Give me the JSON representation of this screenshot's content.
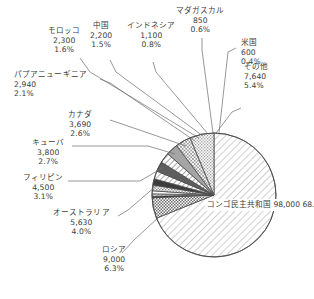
{
  "chart_data": {
    "type": "pie",
    "title": "",
    "subtitle": "",
    "xlabel": "",
    "ylabel": "",
    "legend_position": "none",
    "grid": false,
    "total": 142250,
    "unit": "",
    "label_format": "name / value / percent",
    "categories": [
      "コンゴ民主共和国",
      "ロシア",
      "オーストラリア",
      "フィリピン",
      "キューバ",
      "カナダ",
      "パプアニューギニア",
      "モロッコ",
      "中国",
      "インドネシア",
      "マダガスカル",
      "米国",
      "その他"
    ],
    "values": [
      98000,
      9000,
      5630,
      4500,
      3800,
      3690,
      2940,
      2300,
      2200,
      1100,
      850,
      600,
      7640
    ],
    "percents": [
      "68.9%",
      "6.3%",
      "4.0%",
      "3.1%",
      "2.7%",
      "2.6%",
      "2.1%",
      "1.6%",
      "1.5%",
      "0.8%",
      "0.6%",
      "0.4%",
      "5.4%"
    ],
    "value_labels": [
      "98,000",
      "9,000",
      "5,630",
      "4,500",
      "3,800",
      "3,690",
      "2,940",
      "2,300",
      "2,200",
      "1,100",
      "850",
      "600",
      "7,640"
    ],
    "slices": [
      {
        "name": "コンゴ民主共和国",
        "value_label": "98,000",
        "percent": "68.9%",
        "pct_num": 68.9,
        "fill": "hatch-diag-congo",
        "label_placement": "inside"
      },
      {
        "name": "その他",
        "value_label": "7,640",
        "percent": "5.4%",
        "pct_num": 5.4,
        "fill": "stipple-dark",
        "label_placement": "outside"
      },
      {
        "name": "米国",
        "value_label": "600",
        "percent": "0.4%",
        "pct_num": 0.4,
        "fill": "solid-black",
        "label_placement": "outside"
      },
      {
        "name": "マダガスカル",
        "value_label": "850",
        "percent": "0.6%",
        "pct_num": 0.6,
        "fill": "hatch-fine",
        "label_placement": "outside"
      },
      {
        "name": "インドネシア",
        "value_label": "1,100",
        "percent": "0.8%",
        "pct_num": 0.8,
        "fill": "white-plain",
        "label_placement": "outside"
      },
      {
        "name": "中国",
        "value_label": "2,200",
        "percent": "1.5%",
        "pct_num": 1.5,
        "fill": "stipple-mid",
        "label_placement": "outside"
      },
      {
        "name": "モロッコ",
        "value_label": "2,300",
        "percent": "1.6%",
        "pct_num": 1.6,
        "fill": "solid-dark",
        "label_placement": "outside"
      },
      {
        "name": "パプアニューギニア",
        "value_label": "2,940",
        "percent": "2.1%",
        "pct_num": 2.1,
        "fill": "hatch-wide-white",
        "label_placement": "outside"
      },
      {
        "name": "カナダ",
        "value_label": "3,690",
        "percent": "2.6%",
        "pct_num": 2.6,
        "fill": "solid-darkgray",
        "label_placement": "outside"
      },
      {
        "name": "キューバ",
        "value_label": "3,800",
        "percent": "2.7%",
        "pct_num": 2.7,
        "fill": "hatch-diag-mid",
        "label_placement": "outside"
      },
      {
        "name": "フィリピン",
        "value_label": "4,500",
        "percent": "3.1%",
        "pct_num": 3.1,
        "fill": "solid-midgray",
        "label_placement": "outside"
      },
      {
        "name": "オーストラリア",
        "value_label": "5,630",
        "percent": "4.0%",
        "pct_num": 4.0,
        "fill": "crosshatch",
        "label_placement": "outside"
      },
      {
        "name": "ロシア",
        "value_label": "9,000",
        "percent": "6.3%",
        "pct_num": 6.3,
        "fill": "stipple-light",
        "label_placement": "outside"
      }
    ],
    "colors": {
      "outline": "#4a4a4a",
      "text": "#3b3b3b",
      "leader": "#6b6b6b",
      "background": "#ffffff"
    },
    "geometry": {
      "center_x": 214,
      "center_y": 195,
      "radius": 62,
      "start_angle_deg": 0,
      "direction": "clockwise"
    }
  },
  "labels": {
    "congo": {
      "name": "コンゴ民主共和国",
      "value": "98,000",
      "percent": "68.9%"
    },
    "other": {
      "name": "その他",
      "value": "7,640",
      "percent": "5.4%"
    },
    "usa": {
      "name": "米国",
      "value": "600",
      "percent": "0.4%"
    },
    "madagascar": {
      "name": "マダガスカル",
      "value": "850",
      "percent": "0.6%"
    },
    "indonesia": {
      "name": "インドネシア",
      "value": "1,100",
      "percent": "0.8%"
    },
    "china": {
      "name": "中国",
      "value": "2,200",
      "percent": "1.5%"
    },
    "morocco": {
      "name": "モロッコ",
      "value": "2,300",
      "percent": "1.6%"
    },
    "png": {
      "name": "パプアニューギニア",
      "value": "2,940",
      "percent": "2.1%"
    },
    "canada": {
      "name": "カナダ",
      "value": "3,690",
      "percent": "2.6%"
    },
    "cuba": {
      "name": "キューバ",
      "value": "3,800",
      "percent": "2.7%"
    },
    "philippines": {
      "name": "フィリピン",
      "value": "4,500",
      "percent": "3.1%"
    },
    "australia": {
      "name": "オーストラリア",
      "value": "5,630",
      "percent": "4.0%"
    },
    "russia": {
      "name": "ロシア",
      "value": "9,000",
      "percent": "6.3%"
    }
  }
}
